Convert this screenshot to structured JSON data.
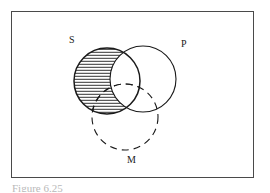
{
  "figure": {
    "caption": "Figure 6.25",
    "frame": {
      "x": 11,
      "y": 11,
      "width": 243,
      "height": 167,
      "border_color": "#4a4a4a"
    }
  },
  "diagram": {
    "type": "venn-three-circle-syllogism",
    "stroke_color": "#1a1a1a",
    "shading_color": "#1a1a1a",
    "circles": [
      {
        "id": "S",
        "label": "S",
        "cx": 107,
        "cy": 81,
        "r": 33,
        "stroke": "solid",
        "label_x": 69,
        "label_y": 35
      },
      {
        "id": "P",
        "label": "P",
        "cx": 143,
        "cy": 79,
        "r": 33,
        "stroke": "solid",
        "label_x": 181,
        "label_y": 39
      },
      {
        "id": "M",
        "label": "M",
        "cx": 125,
        "cy": 117,
        "r": 33,
        "stroke": "dashed",
        "label_x": 127,
        "label_y": 155
      }
    ],
    "shaded_region": {
      "description": "S outside P",
      "expression": "S - P",
      "hatch_style": "horizontal-lines",
      "hatch_spacing_px": 3
    }
  },
  "labels": {
    "subject": "S",
    "predicate": "P",
    "middle": "M"
  }
}
